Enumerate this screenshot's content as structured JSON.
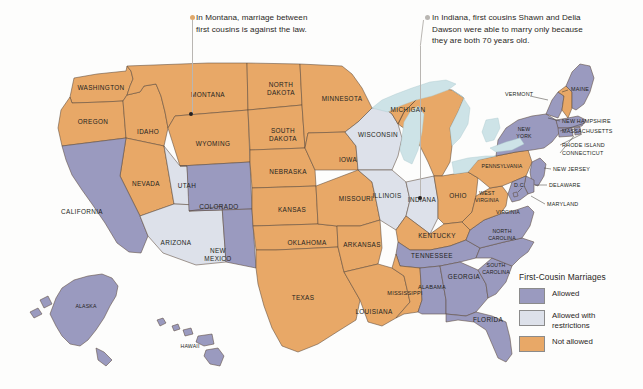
{
  "figure": {
    "name": "first-cousin-marriage-us-map",
    "background_color": "#fdfdfc"
  },
  "colors": {
    "allowed": "#9a9abf",
    "allowed_with_restrictions": "#dde1ea",
    "not_allowed": "#e8a867",
    "water": "#cde3e7",
    "border": "#5b4a3a",
    "text": "#231f20",
    "leader_line": "#b9b6b2",
    "montana_dot": "#e0a96b",
    "indiana_dot": "#b9b6b2"
  },
  "annotations": [
    {
      "id": "montana-note",
      "text": "In Montana, marriage between\nfirst cousins is against the law.",
      "dot_color": "#e0a96b"
    },
    {
      "id": "indiana-note",
      "text": "In Indiana, first cousins Shawn and Delia\nDawson were able to marry only because\nthey are both 70 years old.",
      "dot_color": "#b9b6b2"
    }
  ],
  "legend": {
    "title": "First-Cousin Marriages",
    "items": [
      {
        "label": "Allowed",
        "color": "#9a9abf"
      },
      {
        "label": "Allowed with\nrestrictions",
        "color": "#dde1ea"
      },
      {
        "label": "Not allowed",
        "color": "#e8a867"
      }
    ]
  },
  "map_data": {
    "type": "choropleth",
    "title": "First-Cousin Marriages",
    "categories": [
      "Allowed",
      "Allowed with restrictions",
      "Not allowed"
    ],
    "states": [
      {
        "code": "WA",
        "name": "WASHINGTON",
        "status": "Not allowed"
      },
      {
        "code": "OR",
        "name": "OREGON",
        "status": "Not allowed"
      },
      {
        "code": "ID",
        "name": "IDAHO",
        "status": "Not allowed"
      },
      {
        "code": "MT",
        "name": "MONTANA",
        "status": "Not allowed"
      },
      {
        "code": "WY",
        "name": "WYOMING",
        "status": "Not allowed"
      },
      {
        "code": "NV",
        "name": "NEVADA",
        "status": "Not allowed"
      },
      {
        "code": "UT",
        "name": "UTAH",
        "status": "Allowed with restrictions"
      },
      {
        "code": "CA",
        "name": "CALIFORNIA",
        "status": "Allowed"
      },
      {
        "code": "AZ",
        "name": "ARIZONA",
        "status": "Allowed with restrictions"
      },
      {
        "code": "CO",
        "name": "COLORADO",
        "status": "Allowed"
      },
      {
        "code": "NM",
        "name": "NEW MEXICO",
        "status": "Allowed"
      },
      {
        "code": "ND",
        "name": "NORTH DAKOTA",
        "status": "Not allowed"
      },
      {
        "code": "SD",
        "name": "SOUTH DAKOTA",
        "status": "Not allowed"
      },
      {
        "code": "NE",
        "name": "NEBRASKA",
        "status": "Not allowed"
      },
      {
        "code": "KS",
        "name": "KANSAS",
        "status": "Not allowed"
      },
      {
        "code": "OK",
        "name": "OKLAHOMA",
        "status": "Not allowed"
      },
      {
        "code": "TX",
        "name": "TEXAS",
        "status": "Not allowed"
      },
      {
        "code": "MN",
        "name": "MINNESOTA",
        "status": "Not allowed"
      },
      {
        "code": "IA",
        "name": "IOWA",
        "status": "Not allowed"
      },
      {
        "code": "MO",
        "name": "MISSOURI",
        "status": "Not allowed"
      },
      {
        "code": "AR",
        "name": "ARKANSAS",
        "status": "Not allowed"
      },
      {
        "code": "LA",
        "name": "LOUISIANA",
        "status": "Not allowed"
      },
      {
        "code": "WI",
        "name": "WISCONSIN",
        "status": "Allowed with restrictions"
      },
      {
        "code": "IL",
        "name": "ILLINOIS",
        "status": "Allowed with restrictions"
      },
      {
        "code": "IN",
        "name": "INDIANA",
        "status": "Allowed with restrictions"
      },
      {
        "code": "MI",
        "name": "MICHIGAN",
        "status": "Not allowed"
      },
      {
        "code": "OH",
        "name": "OHIO",
        "status": "Not allowed"
      },
      {
        "code": "KY",
        "name": "KENTUCKY",
        "status": "Not allowed"
      },
      {
        "code": "TN",
        "name": "TENNESSEE",
        "status": "Allowed"
      },
      {
        "code": "MS",
        "name": "MISSISSIPPI",
        "status": "Not allowed"
      },
      {
        "code": "AL",
        "name": "ALABAMA",
        "status": "Allowed"
      },
      {
        "code": "GA",
        "name": "GEORGIA",
        "status": "Allowed"
      },
      {
        "code": "FL",
        "name": "FLORIDA",
        "status": "Allowed"
      },
      {
        "code": "SC",
        "name": "SOUTH CAROLINA",
        "status": "Allowed"
      },
      {
        "code": "NC",
        "name": "NORTH CAROLINA",
        "status": "Allowed"
      },
      {
        "code": "VA",
        "name": "VIRGINIA",
        "status": "Allowed"
      },
      {
        "code": "WV",
        "name": "WEST VIRGINIA",
        "status": "Not allowed"
      },
      {
        "code": "PA",
        "name": "PENNSYLVANIA",
        "status": "Not allowed"
      },
      {
        "code": "NY",
        "name": "NEW YORK",
        "status": "Allowed"
      },
      {
        "code": "VT",
        "name": "VERMONT",
        "status": "Allowed"
      },
      {
        "code": "NH",
        "name": "NEW HAMPSHIRE",
        "status": "Not allowed"
      },
      {
        "code": "ME",
        "name": "MAINE",
        "status": "Allowed"
      },
      {
        "code": "MA",
        "name": "MASSACHUSETTS",
        "status": "Allowed"
      },
      {
        "code": "RI",
        "name": "RHODE ISLAND",
        "status": "Allowed"
      },
      {
        "code": "CT",
        "name": "CONNECTICUT",
        "status": "Allowed"
      },
      {
        "code": "NJ",
        "name": "NEW JERSEY",
        "status": "Allowed"
      },
      {
        "code": "DE",
        "name": "DELAWARE",
        "status": "Allowed"
      },
      {
        "code": "MD",
        "name": "MARYLAND",
        "status": "Allowed"
      },
      {
        "code": "DC",
        "name": "D.C.",
        "status": "Allowed"
      },
      {
        "code": "AK",
        "name": "ALASKA",
        "status": "Allowed"
      },
      {
        "code": "HI",
        "name": "HAWAII",
        "status": "Allowed"
      }
    ]
  },
  "state_labels": {
    "WASHINGTON": "WASHINGTON",
    "OREGON": "OREGON",
    "IDAHO": "IDAHO",
    "MONTANA": "MONTANA",
    "WYOMING": "WYOMING",
    "NEVADA": "NEVADA",
    "UTAH": "UTAH",
    "CALIFORNIA": "CALIFORNIA",
    "ARIZONA": "ARIZONA",
    "COLORADO": "COLORADO",
    "NEW_MEXICO_1": "NEW",
    "NEW_MEXICO_2": "MEXICO",
    "NORTH_DAKOTA_1": "NORTH",
    "NORTH_DAKOTA_2": "DAKOTA",
    "SOUTH_DAKOTA_1": "SOUTH",
    "SOUTH_DAKOTA_2": "DAKOTA",
    "NEBRASKA": "NEBRASKA",
    "KANSAS": "KANSAS",
    "OKLAHOMA": "OKLAHOMA",
    "TEXAS": "TEXAS",
    "MINNESOTA": "MINNESOTA",
    "IOWA": "IOWA",
    "MISSOURI": "MISSOURI",
    "ARKANSAS": "ARKANSAS",
    "LOUISIANA": "LOUISIANA",
    "WISCONSIN": "WISCONSIN",
    "ILLINOIS": "ILLINOIS",
    "INDIANA": "INDIANA",
    "MICHIGAN": "MICHIGAN",
    "OHIO": "OHIO",
    "KENTUCKY": "KENTUCKY",
    "TENNESSEE": "TENNESSEE",
    "MISSISSIPPI": "MISSISSIPPI",
    "ALABAMA": "ALABAMA",
    "GEORGIA": "GEORGIA",
    "FLORIDA": "FLORIDA",
    "SOUTH_CAROLINA_1": "SOUTH",
    "SOUTH_CAROLINA_2": "CAROLINA",
    "NORTH_CAROLINA_1": "NORTH",
    "NORTH_CAROLINA_2": "CAROLINA",
    "VIRGINIA": "VIRGINIA",
    "WEST_VIRGINIA_1": "WEST",
    "WEST_VIRGINIA_2": "VIRGINIA",
    "PENNSYLVANIA": "PENNSYLVANIA",
    "NEW_YORK_1": "NEW",
    "NEW_YORK_2": "YORK",
    "VERMONT": "VERMONT",
    "NEW_HAMPSHIRE": "NEW HAMPSHIRE",
    "MAINE": "MAINE",
    "MASSACHUSETTS": "MASSACHUSETTS",
    "RHODE_ISLAND": "RHODE ISLAND",
    "CONNECTICUT": "CONNECTICUT",
    "NEW_JERSEY": "NEW JERSEY",
    "DELAWARE": "DELAWARE",
    "MARYLAND": "MARYLAND",
    "DC": "D.C.",
    "ALASKA": "ALASKA",
    "HAWAII": "HAWAII"
  }
}
